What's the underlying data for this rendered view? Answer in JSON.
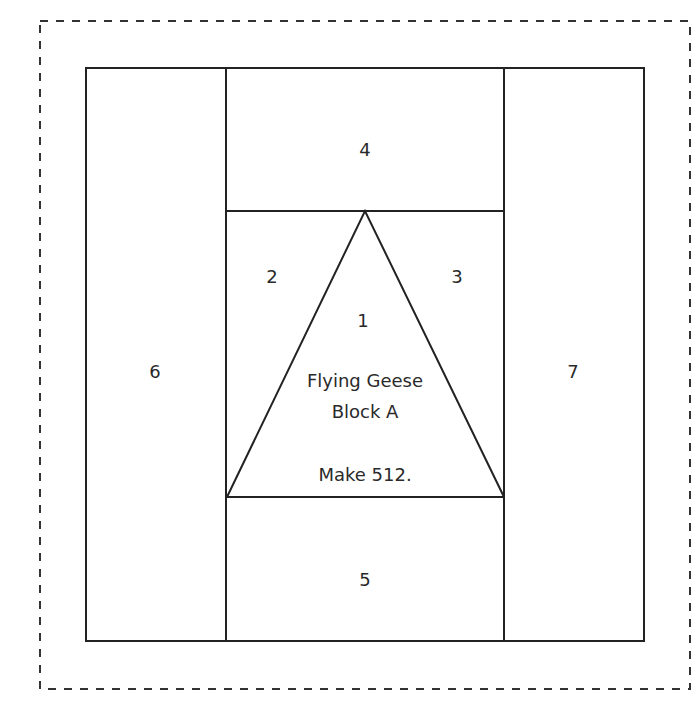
{
  "diagram": {
    "line_color": "#222222",
    "background": "#ffffff",
    "seam_allowance_border": {
      "style": "dashed",
      "x": 40,
      "y": 21,
      "width": 650,
      "height": 668
    },
    "block_outline": {
      "x": 86,
      "y": 68,
      "width": 558,
      "height": 573
    },
    "sections": [
      {
        "id": "1",
        "label": "1",
        "x": 363,
        "y": 327
      },
      {
        "id": "2",
        "label": "2",
        "x": 272,
        "y": 283
      },
      {
        "id": "3",
        "label": "3",
        "x": 457,
        "y": 283
      },
      {
        "id": "4",
        "label": "4",
        "x": 365,
        "y": 156
      },
      {
        "id": "5",
        "label": "5",
        "x": 365,
        "y": 586
      },
      {
        "id": "6",
        "label": "6",
        "x": 155,
        "y": 378
      },
      {
        "id": "7",
        "label": "7",
        "x": 573,
        "y": 378
      }
    ],
    "center_text": {
      "line1": "Flying Geese",
      "line2": "Block A",
      "line3": "Make 512."
    }
  }
}
